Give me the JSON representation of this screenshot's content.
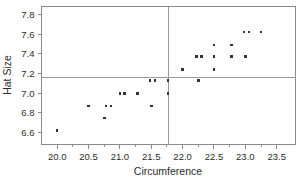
{
  "chart_data": {
    "type": "scatter",
    "title": "",
    "xlabel": "Circumference",
    "ylabel": "Hat Size",
    "xlim": [
      19.75,
      23.8
    ],
    "ylim": [
      6.48,
      7.88
    ],
    "grid": false,
    "legend": null,
    "x_ticks": [
      20.0,
      20.5,
      21.0,
      21.5,
      22.0,
      22.5,
      23.0,
      23.5
    ],
    "x_tick_labels": [
      "20.0",
      "20.5",
      "21.0",
      "21.5",
      "22.0",
      "22.5",
      "23.0",
      "23.5"
    ],
    "x_minor_ticks": [
      20.25,
      20.75,
      21.25,
      21.75,
      22.25,
      22.75,
      23.25
    ],
    "y_ticks": [
      6.6,
      6.8,
      7.0,
      7.2,
      7.4,
      7.6,
      7.8
    ],
    "y_tick_labels": [
      "6.6",
      "6.8",
      "7.0",
      "7.2",
      "7.4",
      "7.6",
      "7.8"
    ],
    "reference_lines": {
      "vertical_x": 21.77,
      "horizontal_y": 7.16
    },
    "marker": {
      "shape": "square",
      "size_px": 2.6,
      "color": "#333333"
    },
    "points": [
      {
        "x": 20.0,
        "y": 6.62
      },
      {
        "x": 20.5,
        "y": 6.87
      },
      {
        "x": 20.75,
        "y": 6.75
      },
      {
        "x": 20.78,
        "y": 6.87
      },
      {
        "x": 20.86,
        "y": 6.87
      },
      {
        "x": 21.0,
        "y": 7.0
      },
      {
        "x": 21.07,
        "y": 7.0
      },
      {
        "x": 21.28,
        "y": 7.0
      },
      {
        "x": 21.5,
        "y": 6.87
      },
      {
        "x": 21.48,
        "y": 7.13
      },
      {
        "x": 21.56,
        "y": 7.13
      },
      {
        "x": 21.77,
        "y": 7.0
      },
      {
        "x": 21.77,
        "y": 7.13
      },
      {
        "x": 22.0,
        "y": 7.24
      },
      {
        "x": 22.25,
        "y": 7.13
      },
      {
        "x": 22.22,
        "y": 7.37
      },
      {
        "x": 22.3,
        "y": 7.37
      },
      {
        "x": 22.5,
        "y": 7.24
      },
      {
        "x": 22.5,
        "y": 7.37
      },
      {
        "x": 22.5,
        "y": 7.49
      },
      {
        "x": 22.78,
        "y": 7.37
      },
      {
        "x": 22.78,
        "y": 7.49
      },
      {
        "x": 23.0,
        "y": 7.37
      },
      {
        "x": 22.98,
        "y": 7.62
      },
      {
        "x": 23.06,
        "y": 7.62
      },
      {
        "x": 23.25,
        "y": 7.62
      }
    ]
  },
  "colors": {
    "marker": "#333333",
    "frame": "#8a8a8a",
    "reference_line": "#9a9a9a",
    "text": "#2b2b2b",
    "background": "#ffffff"
  }
}
